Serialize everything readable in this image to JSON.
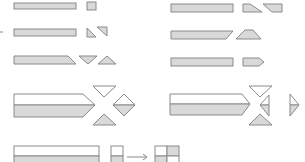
{
  "diagram": {
    "colors": {
      "fill": "#d9d9d9",
      "stroke": "#8a8a8a",
      "background": "#ffffff"
    },
    "rows": [
      {
        "id": "row1-left",
        "pieces": [
          "bar",
          "square"
        ]
      },
      {
        "id": "row1-right",
        "pieces": [
          "bar",
          "trapezoid-right",
          "trapezoid-left"
        ]
      },
      {
        "id": "row2-left",
        "pieces": [
          "bar",
          "triangle-a",
          "triangle-b"
        ]
      },
      {
        "id": "row2-right",
        "pieces": [
          "bar-slanted",
          "trapezoid-up"
        ]
      },
      {
        "id": "row3-left",
        "pieces": [
          "bar-slanted-end",
          "triangle-down",
          "triangle-up"
        ]
      },
      {
        "id": "row3-right",
        "pieces": [
          "bar",
          "pentagon-point"
        ]
      },
      {
        "id": "row4-left",
        "pieces": [
          "two-tone-bar-pointed",
          "triangle-top",
          "diamond",
          "triangle-bottom"
        ]
      },
      {
        "id": "row4-right",
        "pieces": [
          "two-tone-bar-pointed",
          "triangle-top",
          "triangle-left",
          "triangle-right",
          "triangle-bottom"
        ]
      },
      {
        "id": "row5",
        "pieces": [
          "two-tone-bar",
          "small-block",
          "arrow",
          "quad-block"
        ]
      }
    ]
  }
}
